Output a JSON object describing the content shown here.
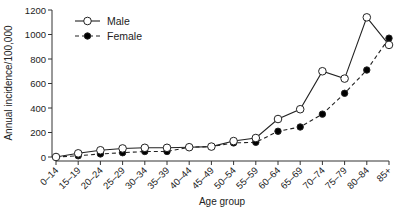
{
  "chart_data": {
    "type": "line",
    "title": "",
    "xlabel": "Age group",
    "ylabel": "Annual incidence/100,000",
    "ylim": [
      0,
      1200
    ],
    "yticks": [
      0,
      200,
      400,
      600,
      800,
      1000,
      1200
    ],
    "grid": false,
    "legend_position": "upper-left",
    "categories": [
      "0–14",
      "15–19",
      "20–24",
      "25–29",
      "30–34",
      "35–39",
      "40–44",
      "45–49",
      "50–54",
      "55–59",
      "60–64",
      "65–69",
      "70–74",
      "75–79",
      "80–84",
      "85+"
    ],
    "series": [
      {
        "name": "Male",
        "style": "solid line, open circle markers",
        "color": "#222222",
        "values": [
          0,
          30,
          55,
          70,
          75,
          75,
          80,
          85,
          130,
          155,
          310,
          390,
          700,
          640,
          1140,
          915
        ]
      },
      {
        "name": "Female",
        "style": "dashed line, filled circle markers",
        "color": "#000000",
        "values": [
          0,
          10,
          25,
          35,
          45,
          45,
          80,
          85,
          115,
          120,
          210,
          245,
          350,
          520,
          710,
          970
        ]
      }
    ]
  }
}
